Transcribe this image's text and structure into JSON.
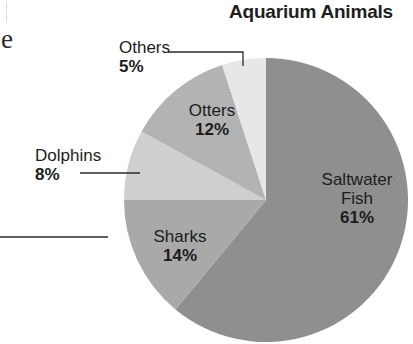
{
  "chart_data": {
    "type": "pie",
    "title": "Aquarium Animals",
    "categories": [
      "Saltwater Fish",
      "Sharks",
      "Dolphins",
      "Otters",
      "Others"
    ],
    "values": [
      61,
      14,
      8,
      12,
      5
    ],
    "unit": "%",
    "colors": [
      "#8f8f8f",
      "#a9a9a9",
      "#cfcfcf",
      "#b3b3b3",
      "#e7e7e7"
    ],
    "start_angle_deg": 0,
    "direction": "clockwise",
    "labels": [
      {
        "name": "Saltwater",
        "name2": "Fish",
        "pct": "61%"
      },
      {
        "name": "Sharks",
        "pct": "14%"
      },
      {
        "name": "Dolphins",
        "pct": "8%"
      },
      {
        "name": "Otters",
        "pct": "12%"
      },
      {
        "name": "Others",
        "pct": "5%"
      }
    ],
    "legend": "none (direct labels)"
  },
  "fragments": {
    "left_text": "e"
  }
}
